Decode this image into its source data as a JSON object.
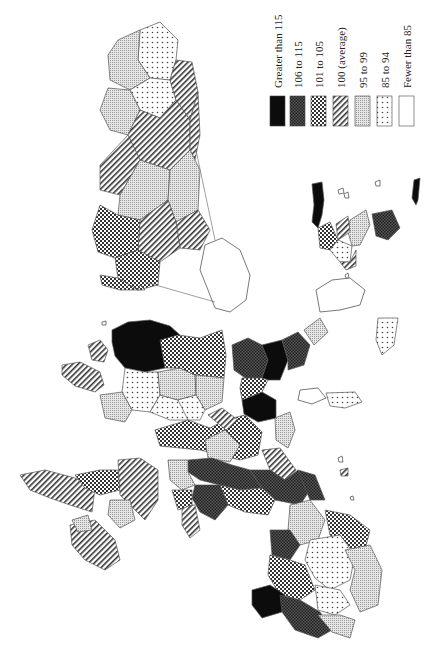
{
  "map": {
    "orientation": "rotated 90 degrees (portrait page, landscape map)",
    "legend": {
      "items": [
        {
          "label": "Greater than 115",
          "pattern": "solid-black"
        },
        {
          "label": "106 to 115",
          "pattern": "dense-dark-crosshatch"
        },
        {
          "label": "101 to 105",
          "pattern": "checker"
        },
        {
          "label": "100 (average)",
          "pattern": "diagonal-hatch"
        },
        {
          "label": "95 to 99",
          "pattern": "fine-grid"
        },
        {
          "label": "85 to 94",
          "pattern": "dots"
        },
        {
          "label": "Fewer than 85",
          "pattern": "blank"
        }
      ]
    },
    "insets": [
      {
        "name": "enlarged-inset-region",
        "position": "top-center"
      },
      {
        "name": "northern-islands-inset",
        "position": "right-middle"
      }
    ]
  },
  "colors": {
    "ink": "#111111",
    "dark": "#3a3a3a",
    "mid": "#7a7a7a",
    "light": "#cfcfcf",
    "background": "#ffffff"
  }
}
